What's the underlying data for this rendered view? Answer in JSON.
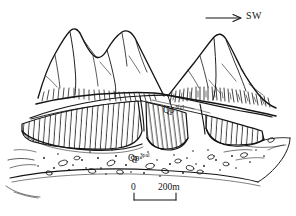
{
  "figure": {
    "kind": "geological-block-diagram",
    "title": "",
    "ink_color": "#151515",
    "background_color": "#ffffff"
  },
  "direction_indicator": {
    "label": "SW",
    "arrow": "arrow-right-icon"
  },
  "units": [
    {
      "id": "fgl",
      "label_base": "Qp",
      "label_sup": "3fgl",
      "description": "fluvioglacial terrace",
      "pattern": "vertical-hatch"
    },
    {
      "id": "pal",
      "label_base": "Qp",
      "label_sup": "3pal",
      "description": "alluvial gravel",
      "pattern": "clast-and-dot"
    }
  ],
  "scale_bar": {
    "start_label": "0",
    "end_label": "200m",
    "length_px": 42
  },
  "landforms": [
    {
      "name": "left-peak",
      "type": "mountain"
    },
    {
      "name": "right-peak",
      "type": "mountain"
    },
    {
      "name": "terrace-surface",
      "type": "terrace"
    },
    {
      "name": "valley-floor",
      "type": "plain"
    }
  ]
}
